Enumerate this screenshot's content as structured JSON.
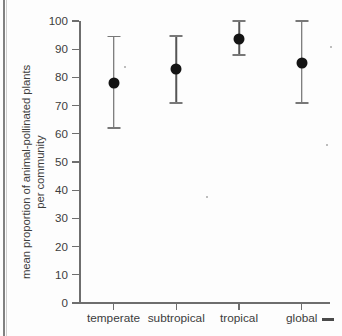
{
  "chart_data": {
    "type": "scatter",
    "title": "",
    "subtitle": "",
    "xlabel": "",
    "ylabel_line1": "mean proportion of animal-pollinated plants",
    "ylabel_line2": "per community",
    "categories": [
      "temperate",
      "subtropical",
      "tropical",
      "global"
    ],
    "values": [
      78,
      83,
      93.7,
      85
    ],
    "error_low": [
      62,
      71,
      88,
      71
    ],
    "error_high": [
      94.5,
      94.7,
      100,
      100
    ],
    "ylim": [
      0,
      100
    ],
    "yticks": [
      0,
      10,
      20,
      30,
      40,
      50,
      60,
      70,
      80,
      90,
      100
    ],
    "ytick_labels": [
      "0",
      "10",
      "20",
      "30",
      "40",
      "50",
      "60",
      "70",
      "80",
      "90",
      "100"
    ],
    "grid": false,
    "legend": false,
    "legend_position": "none",
    "marker": "filled-circle",
    "errorbar_style": "capped-vertical",
    "colors": {
      "marker": "#141414",
      "errorbar": "#555555",
      "errorbar_cap": "#787878",
      "axis": "#6e6e6e",
      "text": "#3c3c3c",
      "background": "#fdfdfd"
    }
  }
}
